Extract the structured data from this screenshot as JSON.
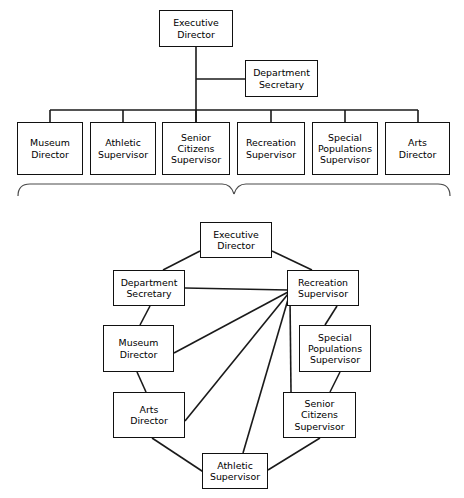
{
  "diagram": {
    "kind": "organizational-chart",
    "description_top": "Hierarchical organization chart of a parks and recreation department",
    "description_bottom": "Network / informal communication chart of the same department",
    "colors": {
      "box_border": "#111111",
      "line": "#1a1a1a",
      "brace": "#4a4a4a",
      "background": "#ffffff",
      "text": "#000000"
    }
  },
  "top_chart": {
    "type": "hierarchy",
    "nodes": [
      {
        "id": "exec",
        "label": "Executive\nDirector",
        "x": 159,
        "y": 10,
        "w": 74,
        "h": 37
      },
      {
        "id": "deptsec",
        "label": "Department\nSecretary",
        "x": 245,
        "y": 60,
        "w": 73,
        "h": 37
      },
      {
        "id": "museum",
        "label": "Museum\nDirector",
        "x": 17,
        "y": 122,
        "w": 66,
        "h": 53
      },
      {
        "id": "athletic",
        "label": "Athletic\nSupervisor",
        "x": 90,
        "y": 122,
        "w": 66,
        "h": 53
      },
      {
        "id": "senior",
        "label": "Senior\nCitizens\nSupervisor",
        "x": 162,
        "y": 122,
        "w": 68,
        "h": 53
      },
      {
        "id": "recreation",
        "label": "Recreation\nSupervisor",
        "x": 237,
        "y": 122,
        "w": 68,
        "h": 53
      },
      {
        "id": "special",
        "label": "Special\nPopulations\nSupervisor",
        "x": 312,
        "y": 122,
        "w": 66,
        "h": 53
      },
      {
        "id": "arts",
        "label": "Arts\nDirector",
        "x": 385,
        "y": 122,
        "w": 65,
        "h": 53
      }
    ],
    "edges": [
      {
        "from": "exec",
        "to": "deptsec",
        "style": "elbow"
      },
      {
        "from": "exec",
        "to": "museum",
        "style": "bus"
      },
      {
        "from": "exec",
        "to": "athletic",
        "style": "bus"
      },
      {
        "from": "exec",
        "to": "senior",
        "style": "bus"
      },
      {
        "from": "exec",
        "to": "recreation",
        "style": "bus"
      },
      {
        "from": "exec",
        "to": "special",
        "style": "bus"
      },
      {
        "from": "exec",
        "to": "arts",
        "style": "bus"
      }
    ]
  },
  "bottom_chart": {
    "type": "network",
    "hub": "recreation",
    "nodes": [
      {
        "id": "exec",
        "label": "Executive\nDirector",
        "x": 200,
        "y": 222,
        "w": 72,
        "h": 36
      },
      {
        "id": "deptsec",
        "label": "Department\nSecretary",
        "x": 113,
        "y": 270,
        "w": 72,
        "h": 36
      },
      {
        "id": "recreation",
        "label": "Recreation\nSupervisor",
        "x": 287,
        "y": 270,
        "w": 72,
        "h": 36
      },
      {
        "id": "museum",
        "label": "Museum\nDirector",
        "x": 103,
        "y": 325,
        "w": 71,
        "h": 47
      },
      {
        "id": "special",
        "label": "Special\nPopulations\nSupervisor",
        "x": 299,
        "y": 325,
        "w": 72,
        "h": 47
      },
      {
        "id": "arts",
        "label": "Arts\nDirector",
        "x": 113,
        "y": 392,
        "w": 72,
        "h": 46
      },
      {
        "id": "senior",
        "label": "Senior\nCitizens\nSupervisor",
        "x": 283,
        "y": 392,
        "w": 73,
        "h": 46
      },
      {
        "id": "athletic",
        "label": "Athletic\nSupervisor",
        "x": 202,
        "y": 453,
        "w": 66,
        "h": 36
      }
    ],
    "edges": [
      {
        "from": "exec",
        "to": "deptsec"
      },
      {
        "from": "exec",
        "to": "recreation"
      },
      {
        "from": "deptsec",
        "to": "recreation"
      },
      {
        "from": "deptsec",
        "to": "museum"
      },
      {
        "from": "museum",
        "to": "recreation"
      },
      {
        "from": "museum",
        "to": "arts"
      },
      {
        "from": "arts",
        "to": "recreation"
      },
      {
        "from": "arts",
        "to": "athletic"
      },
      {
        "from": "athletic",
        "to": "recreation"
      },
      {
        "from": "athletic",
        "to": "senior"
      },
      {
        "from": "senior",
        "to": "recreation"
      },
      {
        "from": "senior",
        "to": "special"
      },
      {
        "from": "special",
        "to": "recreation"
      }
    ]
  },
  "connector": {
    "name": "curly-brace-down",
    "span_left": 18,
    "span_right": 450,
    "tip_x": 234
  }
}
